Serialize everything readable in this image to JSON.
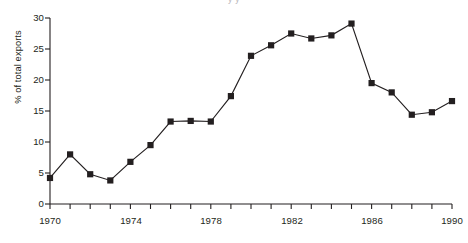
{
  "figure": {
    "clipped_title_fragment": "y                                                             y",
    "background_color": "#ffffff",
    "ink_color": "#231f20"
  },
  "axes": {
    "ylabel": "% of total exports",
    "xlabel": "",
    "y_tick_labels": [
      "0",
      "5",
      "10",
      "15",
      "20",
      "25",
      "30"
    ],
    "x_tick_labels": [
      "1970",
      "1974",
      "1978",
      "1982",
      "1986",
      "1990"
    ]
  },
  "chart_data": {
    "type": "line",
    "title": "",
    "subtitle": "",
    "xlabel": "",
    "ylabel": "% of total exports",
    "xlim": [
      1970,
      1990
    ],
    "ylim": [
      0,
      30
    ],
    "xticks": [
      1970,
      1971,
      1972,
      1973,
      1974,
      1975,
      1976,
      1977,
      1978,
      1979,
      1980,
      1981,
      1982,
      1983,
      1984,
      1985,
      1986,
      1987,
      1988,
      1989,
      1990
    ],
    "xtick_labels_shown": [
      1970,
      1974,
      1978,
      1982,
      1986,
      1990
    ],
    "yticks": [
      0,
      5,
      10,
      15,
      20,
      25,
      30
    ],
    "grid": false,
    "legend": false,
    "legend_position": "none",
    "marker": "filled-square",
    "marker_color": "#231f20",
    "line_color": "#231f20",
    "x": [
      1970,
      1971,
      1972,
      1973,
      1974,
      1975,
      1976,
      1977,
      1978,
      1979,
      1980,
      1981,
      1982,
      1983,
      1984,
      1985,
      1986,
      1987,
      1988,
      1989,
      1990
    ],
    "values": [
      4.2,
      8.0,
      4.8,
      3.8,
      6.8,
      9.5,
      13.3,
      13.4,
      13.3,
      17.4,
      23.9,
      25.6,
      27.5,
      26.7,
      27.2,
      29.1,
      19.5,
      18.0,
      14.4,
      14.8,
      16.6
    ],
    "annotations": []
  }
}
